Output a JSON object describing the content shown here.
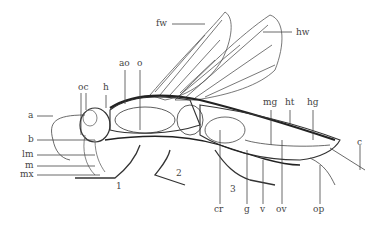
{
  "figure": {
    "labels": {
      "fw": "fw",
      "hw": "hw",
      "ao": "ao",
      "o": "o",
      "oc": "oc",
      "h": "h",
      "a": "a",
      "b": "b",
      "lm": "lm",
      "m": "m",
      "mx": "mx",
      "leg1": "1",
      "leg2": "2",
      "leg3": "3",
      "mg": "mg",
      "ht": "ht",
      "hg": "hg",
      "c": "c",
      "cr": "cr",
      "g": "g",
      "v": "v",
      "ov": "ov",
      "op": "op"
    }
  }
}
